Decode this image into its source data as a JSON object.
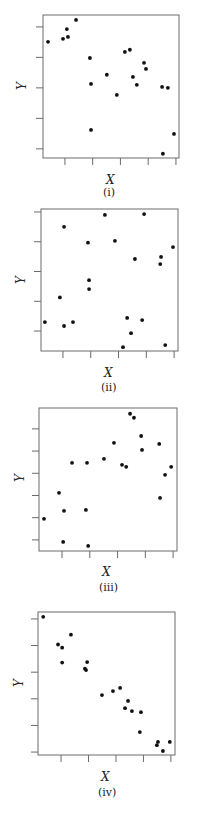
{
  "chart_data": [
    {
      "type": "scatter",
      "caption": "(i)",
      "xlabel": "X",
      "ylabel": "Y",
      "grid": false,
      "legend": null,
      "x_ticks": [
        1,
        2,
        3,
        4,
        5
      ],
      "y_ticks": [
        1,
        2,
        3,
        4,
        5
      ],
      "xlim": [
        0.21,
        5.11
      ],
      "ylim": [
        0.7,
        5.39
      ],
      "tick_labels_shown": false,
      "points": [
        {
          "x": 0.39,
          "y": 4.51
        },
        {
          "x": 0.93,
          "y": 4.61
        },
        {
          "x": 1.07,
          "y": 4.93
        },
        {
          "x": 1.11,
          "y": 4.67
        },
        {
          "x": 1.4,
          "y": 5.23
        },
        {
          "x": 1.9,
          "y": 3.98
        },
        {
          "x": 1.94,
          "y": 3.13
        },
        {
          "x": 1.94,
          "y": 1.62
        },
        {
          "x": 2.51,
          "y": 3.43
        },
        {
          "x": 2.87,
          "y": 2.77
        },
        {
          "x": 3.16,
          "y": 4.18
        },
        {
          "x": 3.34,
          "y": 4.25
        },
        {
          "x": 3.45,
          "y": 3.36
        },
        {
          "x": 3.59,
          "y": 3.1
        },
        {
          "x": 3.85,
          "y": 3.82
        },
        {
          "x": 3.92,
          "y": 3.62
        },
        {
          "x": 4.5,
          "y": 3.03
        },
        {
          "x": 4.71,
          "y": 3.0
        },
        {
          "x": 4.53,
          "y": 0.84
        },
        {
          "x": 4.93,
          "y": 1.49
        }
      ]
    },
    {
      "type": "scatter",
      "caption": "(ii)",
      "xlabel": "X",
      "ylabel": "Y",
      "grid": false,
      "legend": null,
      "x_ticks": [
        1,
        2,
        3,
        4,
        5
      ],
      "y_ticks": [
        1,
        2,
        3,
        4,
        5
      ],
      "xlim": [
        0.21,
        5.14
      ],
      "ylim": [
        0.33,
        5.1
      ],
      "tick_labels_shown": false,
      "points": [
        {
          "x": 0.35,
          "y": 1.3
        },
        {
          "x": 1.04,
          "y": 4.5
        },
        {
          "x": 0.89,
          "y": 2.13
        },
        {
          "x": 1.04,
          "y": 1.17
        },
        {
          "x": 1.36,
          "y": 1.3
        },
        {
          "x": 1.9,
          "y": 3.97
        },
        {
          "x": 1.94,
          "y": 2.71
        },
        {
          "x": 1.94,
          "y": 2.41
        },
        {
          "x": 2.51,
          "y": 4.9
        },
        {
          "x": 2.87,
          "y": 4.03
        },
        {
          "x": 3.16,
          "y": 0.46
        },
        {
          "x": 3.31,
          "y": 1.44
        },
        {
          "x": 3.45,
          "y": 0.93
        },
        {
          "x": 3.59,
          "y": 3.42
        },
        {
          "x": 3.85,
          "y": 1.37
        },
        {
          "x": 3.92,
          "y": 4.93
        },
        {
          "x": 4.5,
          "y": 3.25
        },
        {
          "x": 4.53,
          "y": 3.49
        },
        {
          "x": 4.68,
          "y": 0.53
        },
        {
          "x": 4.96,
          "y": 3.82
        }
      ]
    },
    {
      "type": "scatter",
      "caption": "(iii)",
      "xlabel": "X",
      "ylabel": "Y",
      "grid": false,
      "legend": null,
      "x_ticks": [
        1,
        2,
        3,
        4,
        5
      ],
      "y_ticks": [
        1,
        2,
        3,
        4,
        5,
        6
      ],
      "xlim": [
        0.17,
        5.14
      ],
      "ylim": [
        0.5,
        6.94
      ],
      "tick_labels_shown": false,
      "points": [
        {
          "x": 0.35,
          "y": 1.95
        },
        {
          "x": 0.89,
          "y": 3.12
        },
        {
          "x": 1.04,
          "y": 0.91
        },
        {
          "x": 1.07,
          "y": 2.31
        },
        {
          "x": 1.36,
          "y": 4.47
        },
        {
          "x": 1.86,
          "y": 2.35
        },
        {
          "x": 1.9,
          "y": 4.47
        },
        {
          "x": 1.94,
          "y": 0.73
        },
        {
          "x": 2.51,
          "y": 4.65
        },
        {
          "x": 2.87,
          "y": 5.37
        },
        {
          "x": 3.16,
          "y": 4.38
        },
        {
          "x": 3.31,
          "y": 4.29
        },
        {
          "x": 3.45,
          "y": 6.68
        },
        {
          "x": 3.59,
          "y": 6.5
        },
        {
          "x": 3.85,
          "y": 5.68
        },
        {
          "x": 3.88,
          "y": 5.05
        },
        {
          "x": 4.5,
          "y": 5.32
        },
        {
          "x": 4.53,
          "y": 2.89
        },
        {
          "x": 4.71,
          "y": 3.93
        },
        {
          "x": 4.93,
          "y": 4.29
        }
      ]
    },
    {
      "type": "scatter",
      "caption": "(iv)",
      "xlabel": "X",
      "ylabel": "Y",
      "grid": false,
      "legend": null,
      "x_ticks": [
        1,
        2,
        3,
        4,
        5
      ],
      "y_ticks": [
        1,
        2,
        3,
        4,
        5,
        6
      ],
      "xlim": [
        0.16,
        5.15
      ],
      "ylim": [
        0.89,
        6.26
      ],
      "tick_labels_shown": false,
      "points": [
        {
          "x": 0.35,
          "y": 6.08
        },
        {
          "x": 0.89,
          "y": 5.04
        },
        {
          "x": 1.04,
          "y": 4.92
        },
        {
          "x": 1.04,
          "y": 4.36
        },
        {
          "x": 1.36,
          "y": 5.41
        },
        {
          "x": 1.87,
          "y": 4.13
        },
        {
          "x": 1.91,
          "y": 4.08
        },
        {
          "x": 1.95,
          "y": 4.38
        },
        {
          "x": 2.49,
          "y": 3.14
        },
        {
          "x": 2.89,
          "y": 3.29
        },
        {
          "x": 3.15,
          "y": 3.41
        },
        {
          "x": 3.33,
          "y": 2.65
        },
        {
          "x": 3.44,
          "y": 2.92
        },
        {
          "x": 3.58,
          "y": 2.54
        },
        {
          "x": 3.91,
          "y": 2.5
        },
        {
          "x": 3.87,
          "y": 1.75
        },
        {
          "x": 4.49,
          "y": 1.26
        },
        {
          "x": 4.53,
          "y": 1.38
        },
        {
          "x": 4.71,
          "y": 1.04
        },
        {
          "x": 4.96,
          "y": 1.38
        }
      ]
    }
  ],
  "style": {
    "dot_color": "#111111",
    "axis_color": "#6a6a6a",
    "background": "#ffffff"
  }
}
